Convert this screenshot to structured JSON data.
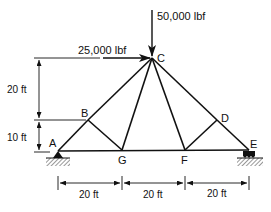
{
  "diagram": {
    "type": "truss",
    "nodes": {
      "A": {
        "label": "A",
        "x": 58,
        "y": 151
      },
      "B": {
        "label": "B",
        "x": 88,
        "y": 120
      },
      "C": {
        "label": "C",
        "x": 152,
        "y": 58
      },
      "D": {
        "label": "D",
        "x": 217,
        "y": 120
      },
      "E": {
        "label": "E",
        "x": 249,
        "y": 150
      },
      "F": {
        "label": "F",
        "x": 185,
        "y": 150
      },
      "G": {
        "label": "G",
        "x": 122,
        "y": 150
      }
    },
    "members": [
      [
        "A",
        "B"
      ],
      [
        "B",
        "C"
      ],
      [
        "C",
        "D"
      ],
      [
        "D",
        "E"
      ],
      [
        "A",
        "G"
      ],
      [
        "G",
        "F"
      ],
      [
        "F",
        "E"
      ],
      [
        "B",
        "G"
      ],
      [
        "G",
        "C"
      ],
      [
        "C",
        "F"
      ],
      [
        "F",
        "D"
      ]
    ],
    "loads": {
      "vertical": {
        "label": "50,000 lbf",
        "node": "C",
        "direction": "down"
      },
      "horizontal": {
        "label": "25,000 lbf",
        "node": "C",
        "direction": "right"
      }
    },
    "supports": {
      "A": "pin",
      "E": "roller"
    },
    "dimensions": {
      "vertical": [
        {
          "label": "20 ft"
        },
        {
          "label": "10 ft"
        }
      ],
      "horizontal": [
        {
          "label": "20 ft"
        },
        {
          "label": "20 ft"
        },
        {
          "label": "20 ft"
        }
      ]
    },
    "colors": {
      "line": "#111111",
      "background": "#ffffff"
    }
  }
}
